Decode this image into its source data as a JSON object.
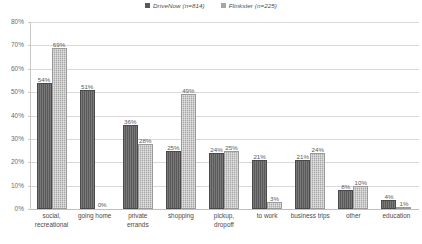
{
  "chart_data": {
    "type": "bar",
    "title": "",
    "subtitle": "",
    "xlabel": "",
    "ylabel": "",
    "ylim": [
      0,
      80
    ],
    "ytick_labels": [
      "80%",
      "70%",
      "60%",
      "50%",
      "40%",
      "30%",
      "20%",
      "10%",
      "0%"
    ],
    "ytick_values": [
      80,
      70,
      60,
      50,
      40,
      30,
      20,
      10,
      0
    ],
    "grid": true,
    "legend_position": "top-center",
    "categories": [
      "social, recreational",
      "going home",
      "private errands",
      "shopping",
      "pickup, dropoff",
      "to work",
      "business trips",
      "other",
      "education"
    ],
    "category_lines": [
      [
        "social,",
        "recreational"
      ],
      [
        "going home"
      ],
      [
        "private",
        "errands"
      ],
      [
        "shopping"
      ],
      [
        "pickup,",
        "dropoff"
      ],
      [
        "to work"
      ],
      [
        "business trips"
      ],
      [
        "other"
      ],
      [
        "education"
      ]
    ],
    "series": [
      {
        "name": "DriveNow (n=814)",
        "color": "#595959",
        "values": [
          54,
          51,
          36,
          25,
          24,
          21,
          21,
          8,
          4
        ],
        "value_labels": [
          "54%",
          "51%",
          "36%",
          "25%",
          "24%",
          "21%",
          "21%",
          "8%",
          "4%"
        ]
      },
      {
        "name": "Flinkster (n=225)",
        "color": "#a6a6a6",
        "values": [
          69,
          0,
          28,
          49,
          25,
          3,
          24,
          10,
          1
        ],
        "value_labels": [
          "69%",
          "0%",
          "28%",
          "49%",
          "25%",
          "3%",
          "24%",
          "10%",
          "1%"
        ]
      }
    ]
  },
  "legend": {
    "items": [
      {
        "label": "DriveNow (n=814)",
        "color": "#595959"
      },
      {
        "label": "Flinkster (n=225)",
        "color": "#a6a6a6"
      }
    ]
  }
}
